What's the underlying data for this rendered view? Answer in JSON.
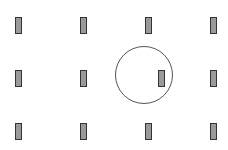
{
  "diagram": {
    "colors": {
      "background": "#ffffff",
      "bar_fill": "#9a9a9a",
      "bar_stroke": "#333333",
      "circle_stroke": "#555555"
    },
    "bars": [
      {
        "row": 0,
        "col": 0,
        "x": 15,
        "y": 17
      },
      {
        "row": 0,
        "col": 1,
        "x": 80,
        "y": 17
      },
      {
        "row": 0,
        "col": 2,
        "x": 145,
        "y": 17
      },
      {
        "row": 0,
        "col": 3,
        "x": 210,
        "y": 17
      },
      {
        "row": 1,
        "col": 0,
        "x": 15,
        "y": 70
      },
      {
        "row": 1,
        "col": 1,
        "x": 80,
        "y": 70
      },
      {
        "row": 1,
        "col": 2,
        "x": 158,
        "y": 70,
        "offset": true
      },
      {
        "row": 1,
        "col": 3,
        "x": 210,
        "y": 70
      },
      {
        "row": 2,
        "col": 0,
        "x": 15,
        "y": 123
      },
      {
        "row": 2,
        "col": 1,
        "x": 80,
        "y": 123
      },
      {
        "row": 2,
        "col": 2,
        "x": 145,
        "y": 123
      },
      {
        "row": 2,
        "col": 3,
        "x": 210,
        "y": 123
      }
    ],
    "circle": {
      "cx": 144,
      "cy": 75,
      "r": 29
    }
  }
}
